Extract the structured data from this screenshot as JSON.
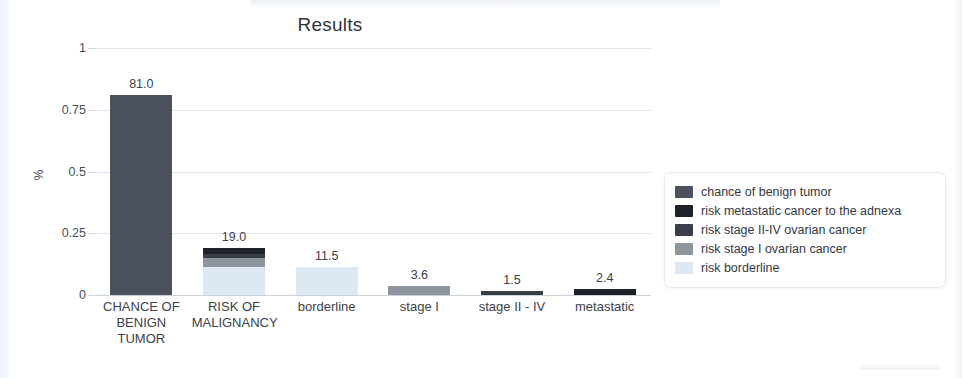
{
  "chart_data": {
    "type": "bar",
    "title": "Results",
    "xlabel": "",
    "ylabel": "%",
    "ylim": [
      0,
      1
    ],
    "grid": true,
    "legend_position": "right",
    "y_ticks": [
      "0",
      "0.25",
      "0.5",
      "0.75",
      "1"
    ],
    "y_tick_values": [
      0,
      0.25,
      0.5,
      0.75,
      1
    ],
    "categories": [
      "CHANCE OF BENIGN TUMOR",
      "RISK OF MALIGNANCY",
      "borderline",
      "stage I",
      "stage II - IV",
      "metastatic"
    ],
    "data_labels": [
      "81.0",
      "19.0",
      "11.5",
      "3.6",
      "1.5",
      "2.4"
    ],
    "values": [
      81.0,
      19.0,
      11.5,
      3.6,
      1.5,
      2.4
    ],
    "series": [
      {
        "name": "chance of benign tumor",
        "color": "#4c525b",
        "values": [
          81.0,
          0,
          0,
          0,
          0,
          0
        ]
      },
      {
        "name": "risk metastatic cancer to the adnexa",
        "color": "#1d2128",
        "values": [
          0,
          2.4,
          0,
          0,
          0,
          2.4
        ]
      },
      {
        "name": "risk stage II-IV ovarian cancer",
        "color": "#3a3f47",
        "values": [
          0,
          1.5,
          0,
          0,
          1.5,
          0
        ]
      },
      {
        "name": "risk stage I ovarian cancer",
        "color": "#8e959d",
        "values": [
          0,
          3.6,
          0,
          3.6,
          0,
          0
        ]
      },
      {
        "name": "risk borderline",
        "color": "#dde8f2",
        "values": [
          0,
          11.5,
          11.5,
          0,
          0,
          0
        ]
      }
    ]
  },
  "chart": {
    "title": "Results",
    "y_axis_label": "%",
    "y_ticks": [
      {
        "label": "1",
        "value": 1
      },
      {
        "label": "0.75",
        "value": 0.75
      },
      {
        "label": "0.5",
        "value": 0.5
      },
      {
        "label": "0.25",
        "value": 0.25
      },
      {
        "label": "0",
        "value": 0
      }
    ],
    "bars": [
      {
        "category": "CHANCE OF BENIGN TUMOR",
        "label_lines": "CHANCE OF BENIGN TUMOR",
        "value_label": "81.0",
        "total": 81.0,
        "segments": [
          {
            "series": "chance of benign tumor",
            "value": 81.0,
            "color": "#4c525b"
          }
        ]
      },
      {
        "category": "RISK OF MALIGNANCY",
        "label_lines": "RISK OF MALIGNANCY",
        "value_label": "19.0",
        "total": 19.0,
        "segments": [
          {
            "series": "risk metastatic cancer to the adnexa",
            "value": 2.4,
            "color": "#1d2128"
          },
          {
            "series": "risk stage II-IV ovarian cancer",
            "value": 1.5,
            "color": "#3a3f47"
          },
          {
            "series": "risk stage I ovarian cancer",
            "value": 3.6,
            "color": "#8e959d"
          },
          {
            "series": "risk borderline",
            "value": 11.5,
            "color": "#dde8f2"
          }
        ]
      },
      {
        "category": "borderline",
        "label_lines": "borderline",
        "value_label": "11.5",
        "total": 11.5,
        "segments": [
          {
            "series": "risk borderline",
            "value": 11.5,
            "color": "#dde8f2"
          }
        ]
      },
      {
        "category": "stage I",
        "label_lines": "stage I",
        "value_label": "3.6",
        "total": 3.6,
        "segments": [
          {
            "series": "risk stage I ovarian cancer",
            "value": 3.6,
            "color": "#8e959d"
          }
        ]
      },
      {
        "category": "stage II - IV",
        "label_lines": "stage II - IV",
        "value_label": "1.5",
        "total": 1.5,
        "segments": [
          {
            "series": "risk stage II-IV ovarian cancer",
            "value": 1.5,
            "color": "#3a3f47"
          }
        ]
      },
      {
        "category": "metastatic",
        "label_lines": "metastatic",
        "value_label": "2.4",
        "total": 2.4,
        "segments": [
          {
            "series": "risk metastatic cancer to the adnexa",
            "value": 2.4,
            "color": "#1d2128"
          }
        ]
      }
    ],
    "legend": [
      {
        "label": "chance of benign tumor",
        "color": "#4c525b"
      },
      {
        "label": "risk metastatic cancer to the adnexa",
        "color": "#1d2128"
      },
      {
        "label": "risk stage II-IV ovarian cancer",
        "color": "#3a3f47"
      },
      {
        "label": "risk stage I ovarian cancer",
        "color": "#8e959d"
      },
      {
        "label": "risk borderline",
        "color": "#dde8f2"
      }
    ]
  }
}
